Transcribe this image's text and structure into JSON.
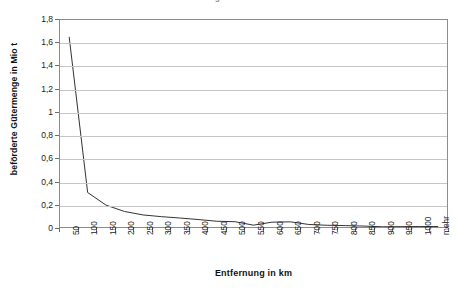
{
  "chart_data": {
    "type": "line",
    "title": "Verkehrsaufkommen nach Entfernungsklassen",
    "xlabel": "Entfernung in km",
    "ylabel": "beförderte Gütermenge in Mio t",
    "categories": [
      "50",
      "100",
      "150",
      "200",
      "250",
      "300",
      "350",
      "400",
      "450",
      "500",
      "550",
      "600",
      "650",
      "700",
      "750",
      "800",
      "850",
      "900",
      "950",
      "1000",
      "mehr"
    ],
    "values": [
      1.65,
      0.3,
      0.19,
      0.135,
      0.105,
      0.09,
      0.078,
      0.065,
      0.05,
      0.046,
      0.016,
      0.042,
      0.045,
      0.022,
      0.015,
      0.012,
      0.008,
      0.002,
      0.003,
      0.004,
      0.004
    ],
    "series": [
      {
        "name": "beförderte Gütermenge",
        "values": [
          1.65,
          0.3,
          0.19,
          0.135,
          0.105,
          0.09,
          0.078,
          0.065,
          0.05,
          0.046,
          0.016,
          0.042,
          0.045,
          0.022,
          0.015,
          0.012,
          0.008,
          0.002,
          0.003,
          0.004,
          0.004
        ],
        "color": "#333333"
      }
    ],
    "ylim": [
      0,
      1.8
    ],
    "ytick_step": 0.2,
    "ytick_labels": [
      "0",
      "0,2",
      "0,4",
      "0,6",
      "0,8",
      "1",
      "1,2",
      "1,4",
      "1,6",
      "1,8"
    ],
    "ytick_values": [
      0,
      0.2,
      0.4,
      0.6,
      0.8,
      1,
      1.2,
      1.4,
      1.6,
      1.8
    ],
    "grid": "horizontal",
    "legend": "none",
    "decimal_separator": ",",
    "colors": {
      "line": "#333333",
      "gridline": "#c6c6c6",
      "axis": "#8c8c8c",
      "background": "#ffffff",
      "text": "#1a1a1a"
    }
  }
}
